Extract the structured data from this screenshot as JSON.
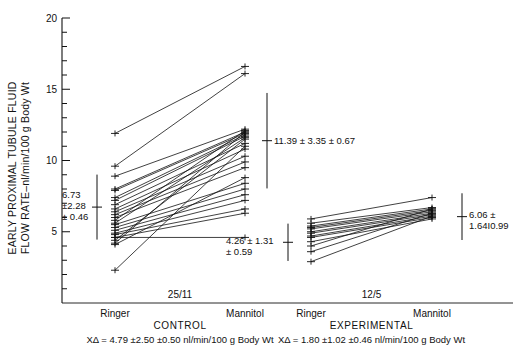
{
  "chart_data": {
    "type": "line",
    "title": "",
    "ylabel": "EARLY PROXIMAL TUBULE FLUID FLOW RATE—nl/min/100 g Body Wt",
    "xlabel": "",
    "ylim": [
      0,
      20
    ],
    "yticks_major": [
      5,
      10,
      15,
      20
    ],
    "yticks_major_labels": [
      "5",
      "10",
      "15",
      "20"
    ],
    "ytick_minor_step": 1,
    "grid": false,
    "legend": "none",
    "panels": [
      {
        "key": "control",
        "name": "CONTROL",
        "n_label": "25/11",
        "categories": [
          "Ringer",
          "Mannitol"
        ],
        "pairs": [
          [
            11.9,
            16.6
          ],
          [
            9.6,
            16.1
          ],
          [
            8.9,
            12.2
          ],
          [
            8.0,
            12.0
          ],
          [
            7.9,
            11.9
          ],
          [
            7.4,
            11.8
          ],
          [
            7.2,
            11.7
          ],
          [
            6.9,
            11.2
          ],
          [
            6.6,
            10.8
          ],
          [
            6.4,
            10.3
          ],
          [
            6.2,
            9.9
          ],
          [
            6.0,
            9.5
          ],
          [
            5.8,
            12.1
          ],
          [
            5.6,
            11.6
          ],
          [
            5.5,
            8.4
          ],
          [
            5.3,
            8.0
          ],
          [
            5.1,
            7.6
          ],
          [
            4.9,
            7.2
          ],
          [
            4.8,
            6.6
          ],
          [
            4.6,
            6.3
          ],
          [
            4.6,
            4.6
          ],
          [
            4.4,
            11.5
          ],
          [
            4.2,
            12.0
          ],
          [
            4.1,
            8.8
          ],
          [
            2.3,
            11.0
          ]
        ],
        "mean_left": {
          "value": 6.73,
          "sd": 2.28,
          "sem": 0.46,
          "label_lines": [
            "6.73",
            "±2.28",
            "± 0.46"
          ]
        },
        "mean_right": {
          "value": 11.39,
          "sd": 3.35,
          "sem": 0.67,
          "label_lines": [
            "11.39 ± 3.35 ± 0.67"
          ]
        },
        "mean_right_low": {
          "value": 4.26,
          "sd": 1.31,
          "sem": 0.59,
          "label_lines": [
            "4.26 ± 1.31",
            "± 0.59"
          ]
        },
        "delta_footer": "XΔ = 4.79  ±2.50  ±0.50 nl/min/100 g Body Wt"
      },
      {
        "key": "experimental",
        "name": "EXPERIMENTAL",
        "n_label": "12/5",
        "categories": [
          "Ringer",
          "Mannitol"
        ],
        "pairs": [
          [
            5.9,
            7.4
          ],
          [
            5.6,
            6.7
          ],
          [
            5.4,
            6.6
          ],
          [
            5.3,
            6.5
          ],
          [
            5.2,
            6.4
          ],
          [
            5.0,
            6.3
          ],
          [
            4.9,
            6.2
          ],
          [
            4.7,
            6.1
          ],
          [
            4.6,
            6.0
          ],
          [
            4.3,
            5.9
          ],
          [
            4.0,
            6.6
          ],
          [
            3.6,
            6.3
          ],
          [
            2.9,
            6.1
          ]
        ],
        "mean_right": {
          "value": 6.06,
          "sd": 1.64,
          "sem": 0.99,
          "label_lines": [
            "6.06 ±",
            "1.64I0.99"
          ]
        },
        "delta_footer": "XΔ = 1.80  ±1.02  ±0.46 nl/min/100 g Body Wt"
      }
    ],
    "annotations": [
      "6.73 ±2.28 ± 0.46",
      "11.39 ± 3.35 ± 0.67",
      "4.26 ± 1.31 ± 0.59",
      "6.06 ± 1.64I0.99",
      "25/11",
      "12/5"
    ]
  },
  "colors": {
    "ink": "#111111",
    "background": "#ffffff"
  }
}
